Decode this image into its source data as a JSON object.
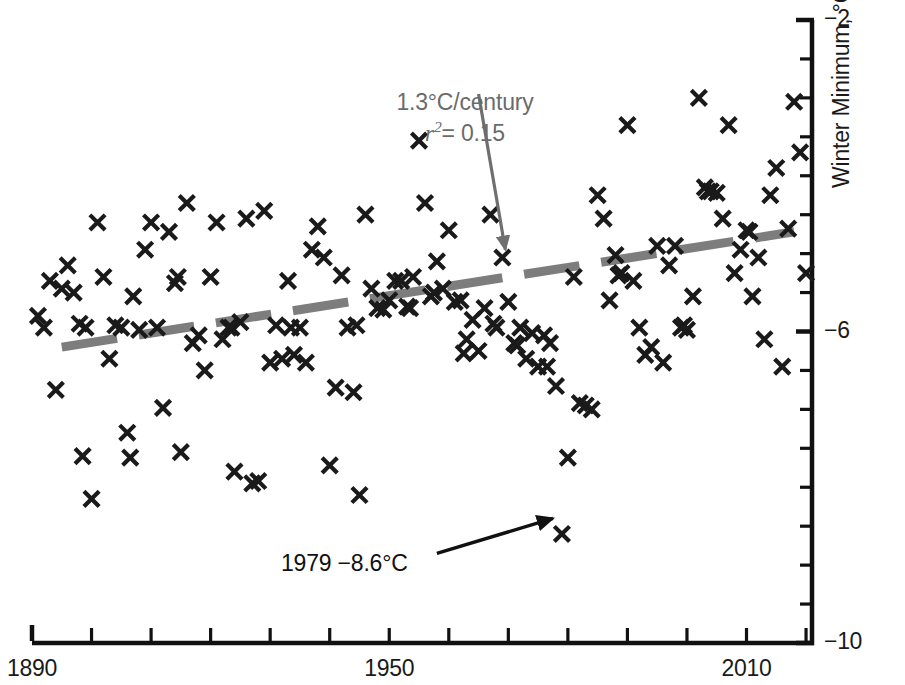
{
  "chart_data": {
    "type": "scatter",
    "title": "",
    "xlabel": "",
    "ylabel": "Winter Minimum, °C",
    "xlim": [
      1890,
      2021
    ],
    "ylim": [
      -10,
      -2
    ],
    "xticks": [
      1890,
      1900,
      1910,
      1920,
      1930,
      1940,
      1950,
      1960,
      1970,
      1980,
      1990,
      2000,
      2010,
      2020
    ],
    "xtick_labels": [
      "1890",
      "",
      "",
      "",
      "",
      "",
      "1950",
      "",
      "",
      "",
      "",
      "",
      "2010",
      ""
    ],
    "yticks": [
      -10,
      -9.5,
      -9,
      -8.5,
      -8,
      -7.5,
      -7,
      -6.5,
      -6,
      -5.5,
      -5,
      -4.5,
      -4,
      -3.5,
      -3,
      -2.5,
      -2
    ],
    "ytick_labels": [
      "-10",
      "",
      "",
      "",
      "",
      "",
      "",
      "",
      "-6",
      "",
      "",
      "",
      "",
      "",
      "",
      "",
      "-2"
    ],
    "ytick_label_positions": [
      -2,
      -6,
      -10
    ],
    "ytick_label_text": [
      "−2",
      "−6",
      "−10"
    ],
    "grid": false,
    "legend": null,
    "marker": "x",
    "marker_color": "#1a1a1a",
    "series": [
      {
        "name": "Winter minimum temperature",
        "points": [
          [
            1893,
            -5.35
          ],
          [
            1894,
            -6.75
          ],
          [
            1895,
            -5.45
          ],
          [
            1896,
            -5.15
          ],
          [
            1897,
            -5.5
          ],
          [
            1898,
            -5.9
          ],
          [
            1899,
            -5.95
          ],
          [
            1900,
            -8.15
          ],
          [
            1901,
            -4.6
          ],
          [
            1902,
            -5.3
          ],
          [
            1903,
            -6.35
          ],
          [
            1904,
            -5.92
          ],
          [
            1905,
            -5.95
          ],
          [
            1906,
            -7.3
          ],
          [
            1907,
            -5.55
          ],
          [
            1908,
            -5.98
          ],
          [
            1909,
            -4.95
          ],
          [
            1910,
            -4.6
          ],
          [
            1911,
            -5.95
          ],
          [
            1912,
            -6.98
          ],
          [
            1913,
            -4.72
          ],
          [
            1914,
            -5.38
          ],
          [
            1915,
            -7.55
          ],
          [
            1916,
            -4.35
          ],
          [
            1917,
            -6.15
          ],
          [
            1918,
            -6.05
          ],
          [
            1919,
            -6.5
          ],
          [
            1920,
            -5.3
          ],
          [
            1921,
            -4.6
          ],
          [
            1922,
            -6.1
          ],
          [
            1923,
            -5.95
          ],
          [
            1924,
            -7.8
          ],
          [
            1925,
            -5.88
          ],
          [
            1926,
            -4.55
          ],
          [
            1927,
            -7.95
          ],
          [
            1928,
            -7.92
          ],
          [
            1929,
            -4.45
          ],
          [
            1930,
            -6.4
          ],
          [
            1931,
            -5.92
          ],
          [
            1932,
            -6.35
          ],
          [
            1933,
            -5.35
          ],
          [
            1934,
            -6.3
          ],
          [
            1935,
            -5.95
          ],
          [
            1936,
            -6.4
          ],
          [
            1937,
            -4.95
          ],
          [
            1938,
            -4.65
          ],
          [
            1939,
            -5.05
          ],
          [
            1940,
            -7.72
          ],
          [
            1941,
            -6.72
          ],
          [
            1942,
            -5.28
          ],
          [
            1943,
            -5.95
          ],
          [
            1944,
            -6.78
          ],
          [
            1945,
            -8.1
          ],
          [
            1946,
            -4.5
          ],
          [
            1947,
            -5.45
          ],
          [
            1948,
            -5.7
          ],
          [
            1949,
            -5.72
          ],
          [
            1950,
            -5.6
          ],
          [
            1951,
            -5.35
          ],
          [
            1952,
            -5.35
          ],
          [
            1953,
            -5.68
          ],
          [
            1954,
            -5.3
          ],
          [
            1955,
            -3.55
          ],
          [
            1956,
            -4.35
          ],
          [
            1957,
            -5.55
          ],
          [
            1958,
            -5.1
          ],
          [
            1959,
            -5.45
          ],
          [
            1960,
            -4.7
          ],
          [
            1961,
            -5.62
          ],
          [
            1962,
            -5.6
          ],
          [
            1963,
            -6.1
          ],
          [
            1964,
            -5.85
          ],
          [
            1965,
            -6.25
          ],
          [
            1966,
            -5.7
          ],
          [
            1967,
            -4.5
          ],
          [
            1968,
            -5.95
          ],
          [
            1969,
            -5.05
          ],
          [
            1970,
            -5.62
          ],
          [
            1971,
            -6.15
          ],
          [
            1972,
            -5.95
          ],
          [
            1973,
            -6.35
          ],
          [
            1974,
            -6.02
          ],
          [
            1975,
            -6.45
          ],
          [
            1976,
            -6.05
          ],
          [
            1977,
            -6.15
          ],
          [
            1978,
            -6.7
          ],
          [
            1979,
            -8.6
          ],
          [
            1980,
            -7.62
          ],
          [
            1981,
            -5.3
          ],
          [
            1982,
            -6.92
          ],
          [
            1983,
            -6.95
          ],
          [
            1984,
            -7.0
          ],
          [
            1985,
            -4.25
          ],
          [
            1986,
            -4.55
          ],
          [
            1987,
            -5.6
          ],
          [
            1988,
            -5.02
          ],
          [
            1989,
            -5.25
          ],
          [
            1990,
            -3.35
          ],
          [
            1991,
            -5.35
          ],
          [
            1992,
            -5.95
          ],
          [
            1993,
            -6.3
          ],
          [
            1994,
            -6.2
          ],
          [
            1995,
            -4.9
          ],
          [
            1996,
            -6.4
          ],
          [
            1997,
            -5.15
          ],
          [
            1998,
            -4.9
          ],
          [
            1999,
            -5.95
          ],
          [
            2000,
            -5.98
          ],
          [
            2001,
            -5.55
          ],
          [
            2002,
            -3.0
          ],
          [
            2003,
            -4.15
          ],
          [
            2004,
            -4.2
          ],
          [
            2005,
            -4.22
          ],
          [
            2006,
            -4.55
          ],
          [
            2007,
            -3.35
          ],
          [
            2008,
            -5.25
          ],
          [
            2009,
            -4.95
          ],
          [
            2010,
            -4.7
          ],
          [
            2011,
            -5.55
          ],
          [
            2012,
            -5.05
          ],
          [
            2013,
            -6.1
          ],
          [
            2014,
            -4.25
          ],
          [
            2015,
            -3.9
          ],
          [
            2016,
            -6.45
          ],
          [
            2017,
            -4.68
          ],
          [
            2018,
            -3.05
          ],
          [
            2019,
            -3.7
          ],
          [
            2020,
            -5.25
          ],
          [
            1891,
            -5.8
          ],
          [
            1892,
            -5.95
          ],
          [
            1898.5,
            -7.6
          ],
          [
            1906.5,
            -7.62
          ],
          [
            1914.5,
            -5.3
          ],
          [
            1923.5,
            -5.95
          ],
          [
            1933.5,
            -5.95
          ],
          [
            1944.5,
            -5.92
          ],
          [
            1953.5,
            -5.7
          ],
          [
            1957.5,
            -5.5
          ],
          [
            1962.5,
            -6.28
          ],
          [
            1967.5,
            -5.9
          ],
          [
            1971.5,
            -6.18
          ],
          [
            1976.5,
            -6.45
          ],
          [
            1988.5,
            -5.28
          ],
          [
            1999.5,
            -5.92
          ],
          [
            2003.5,
            -4.2
          ],
          [
            2010.5,
            -4.72
          ]
        ]
      }
    ],
    "trendline": {
      "label": "1.3°C/century",
      "r_squared_label": "r² = 0.15",
      "slope_per_century": 1.3,
      "r_squared": 0.15,
      "style": "dashed",
      "color": "#7d7d7d",
      "x_start": 1895,
      "y_start": -6.2,
      "x_end": 2018,
      "y_end": -4.72
    },
    "annotations": [
      {
        "name": "trendline-callout",
        "line1": "1.3°C/century",
        "line2_prefix": "r",
        "line2_sup": "2",
        "line2_suffix": "= 0.15",
        "color": "#6b6b6b",
        "arrow_from": [
          1965,
          -2.95
        ],
        "arrow_to": [
          1969.5,
          -4.95
        ]
      },
      {
        "name": "outlier-callout",
        "text": "1979 −8.6°C",
        "color": "#111111",
        "arrow_from": [
          1958,
          -8.85
        ],
        "arrow_to": [
          1977.5,
          -8.4
        ]
      }
    ]
  },
  "axes": {
    "y_axis_title": "Winter Minimum, °C",
    "y_labels": [
      {
        "text": "−2",
        "value": -2
      },
      {
        "text": "−6",
        "value": -6
      },
      {
        "text": "−10",
        "value": -10
      }
    ],
    "x_labels": [
      {
        "text": "1890",
        "value": 1890
      },
      {
        "text": "1950",
        "value": 1950
      },
      {
        "text": "2010",
        "value": 2010
      }
    ],
    "axis_color": "#111111"
  },
  "annotation_text": {
    "trend_line1": "1.3°C/century",
    "trend_r": "r",
    "trend_r_sup": "2",
    "trend_r_rest": "= 0.15",
    "outlier": "1979 −8.6°C"
  }
}
